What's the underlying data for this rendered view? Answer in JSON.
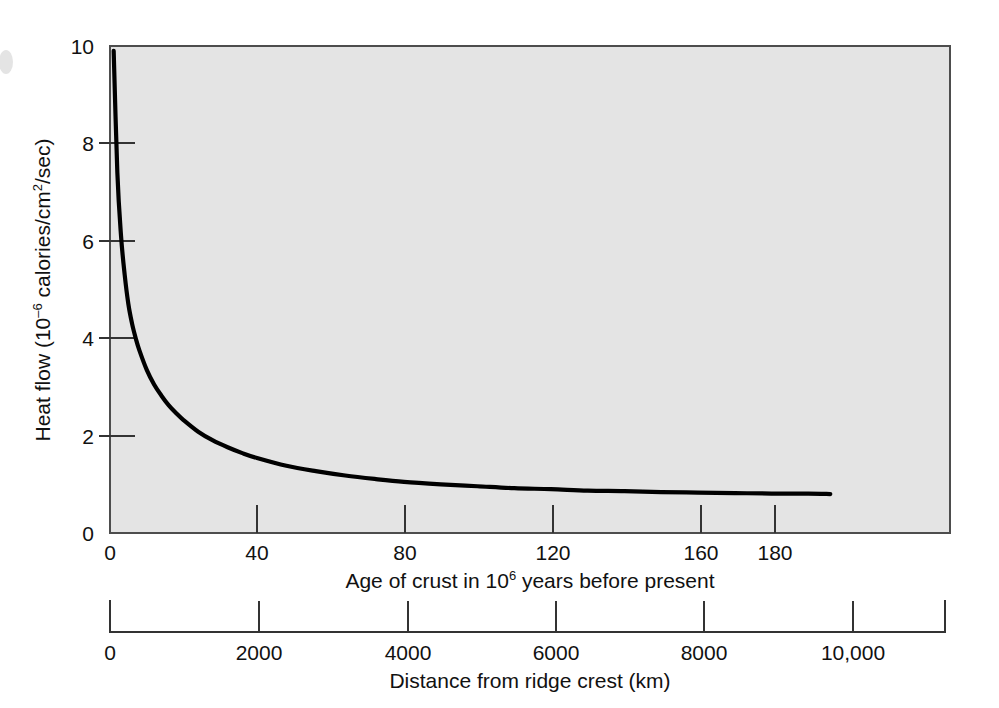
{
  "figure": {
    "background_color": "#ffffff",
    "plot_background_color": "#e4e4e4",
    "curve_color": "#000000",
    "axis_color": "#333333"
  },
  "yaxis": {
    "title_main": "Heat flow (10",
    "title_sup": "–6",
    "title_rest": " calories/cm",
    "title_sup2": "2",
    "title_end": "/sec)",
    "title_full": "Heat flow (10–6 calories/cm2/sec)",
    "ticks": [
      "0",
      "2",
      "4",
      "6",
      "8",
      "10"
    ]
  },
  "xaxis_top": {
    "title_main": "Age of crust in 10",
    "title_sup": "6",
    "title_rest": " years before present",
    "title_full": "Age of crust in 106 years before present",
    "ticks": [
      "0",
      "40",
      "80",
      "120",
      "160",
      "180"
    ]
  },
  "xaxis_bottom": {
    "title": "Distance from ridge crest (km)",
    "ticks": [
      "0",
      "2000",
      "4000",
      "6000",
      "8000",
      "10,000"
    ]
  },
  "chart_data": {
    "type": "line",
    "title": "",
    "subtitle": "",
    "xlabel": "Age of crust in 10^6 years before present",
    "ylabel": "Heat flow (10^-6 calories/cm^2/sec)",
    "secondary_xlabel": "Distance from ridge crest (km)",
    "grid": false,
    "legend": "none",
    "xlim": [
      0,
      200
    ],
    "ylim": [
      0,
      10
    ],
    "secondary_xlim": [
      0,
      11250
    ],
    "xticks": [
      0,
      40,
      80,
      120,
      160,
      180
    ],
    "yticks": [
      0,
      2,
      4,
      6,
      8,
      10
    ],
    "secondary_xticks": [
      0,
      2000,
      4000,
      6000,
      8000,
      10000
    ],
    "series": [
      {
        "name": "Oceanic heat flow vs crustal age",
        "x": [
          1,
          2,
          3,
          4,
          5,
          6,
          7,
          8,
          10,
          12,
          14,
          16,
          18,
          20,
          24,
          28,
          32,
          36,
          40,
          48,
          56,
          64,
          72,
          80,
          90,
          100,
          110,
          120,
          130,
          140,
          150,
          160,
          170,
          180,
          190,
          196
        ],
        "y": [
          9.9,
          7.4,
          6.1,
          5.3,
          4.7,
          4.3,
          4.0,
          3.75,
          3.35,
          3.05,
          2.82,
          2.62,
          2.46,
          2.32,
          2.08,
          1.9,
          1.76,
          1.64,
          1.54,
          1.38,
          1.27,
          1.18,
          1.11,
          1.05,
          1.0,
          0.96,
          0.92,
          0.9,
          0.87,
          0.86,
          0.84,
          0.83,
          0.82,
          0.81,
          0.81,
          0.8
        ]
      }
    ]
  }
}
